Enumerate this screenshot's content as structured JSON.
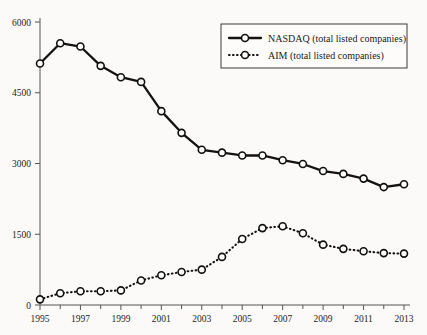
{
  "chart_data": {
    "type": "line",
    "title": "",
    "xlabel": "",
    "ylabel": "",
    "x": [
      1995,
      1996,
      1997,
      1998,
      1999,
      2000,
      2001,
      2002,
      2003,
      2004,
      2005,
      2006,
      2007,
      2008,
      2009,
      2010,
      2011,
      2012,
      2013
    ],
    "xlim": [
      1995,
      2013
    ],
    "ylim": [
      0,
      6000
    ],
    "yticks": [
      0,
      1500,
      3000,
      4500,
      6000
    ],
    "ytick_labels": [
      "0",
      "1500",
      "3000",
      "4500",
      "6000"
    ],
    "xticks": [
      1995,
      1997,
      1999,
      2001,
      2003,
      2005,
      2007,
      2009,
      2011,
      2013
    ],
    "xtick_labels": [
      "1995",
      "1997",
      "1999",
      "2001",
      "2003",
      "2005",
      "2007",
      "2009",
      "2011",
      "2013"
    ],
    "xminor_ticks": [
      1996,
      1998,
      2000,
      2002,
      2004,
      2006,
      2008,
      2010,
      2012
    ],
    "grid": false,
    "legend_position": "top-right",
    "series": [
      {
        "name": "NASDAQ (total listed companies)",
        "key": "nasdaq",
        "style": "solid",
        "marker": "open-circle",
        "color": "#121212",
        "values": [
          5120,
          5550,
          5480,
          5070,
          4830,
          4730,
          4110,
          3650,
          3290,
          3230,
          3170,
          3170,
          3070,
          2990,
          2840,
          2780,
          2680,
          2500,
          2560
        ]
      },
      {
        "name": "AIM (total listed companies)",
        "key": "aim",
        "style": "dotted",
        "marker": "open-circle",
        "color": "#121212",
        "values": [
          120,
          250,
          290,
          290,
          310,
          520,
          630,
          700,
          750,
          1020,
          1400,
          1630,
          1670,
          1520,
          1280,
          1190,
          1140,
          1100,
          1090
        ]
      }
    ]
  },
  "legend": {
    "items": [
      {
        "label": "NASDAQ (total listed companies)",
        "style": "solid"
      },
      {
        "label": "AIM (total listed companies)",
        "style": "dotted"
      }
    ]
  }
}
